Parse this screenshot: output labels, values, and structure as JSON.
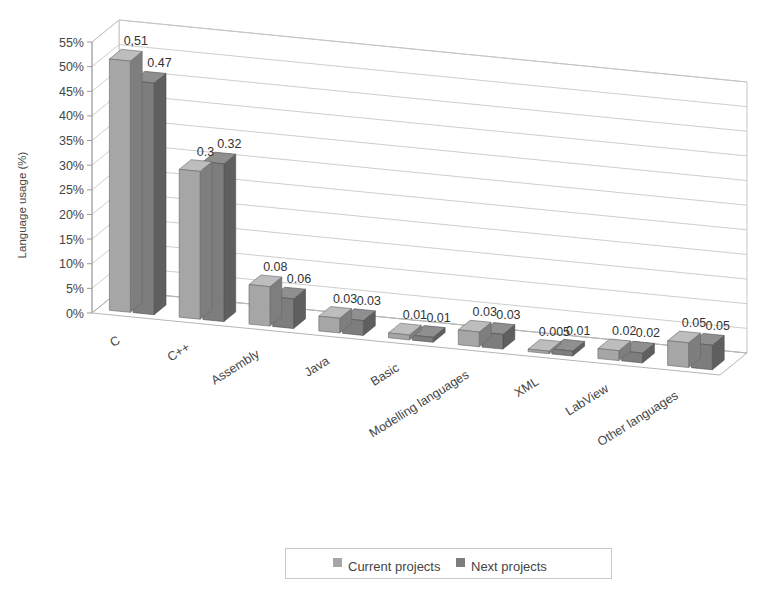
{
  "chart_data": {
    "type": "bar",
    "title": "",
    "subtitle": "",
    "xlabel": "",
    "ylabel": "Language usage (%)",
    "categories": [
      "C",
      "C++",
      "Assembly",
      "Java",
      "Basic",
      "Modelling languages",
      "XML",
      "LabView",
      "Other languages"
    ],
    "series": [
      {
        "name": "Current projects",
        "color": "#a6a6a6",
        "values": [
          0.51,
          0.3,
          0.08,
          0.03,
          0.01,
          0.03,
          0.005,
          0.02,
          0.05
        ],
        "labels": [
          "0,51",
          "0.3",
          "0.08",
          "0.03",
          "0.01",
          "0.03",
          "0.005",
          "0.02",
          "0.05"
        ]
      },
      {
        "name": "Next projects",
        "color": "#7d7d7d",
        "values": [
          0.47,
          0.32,
          0.06,
          0.03,
          0.01,
          0.03,
          0.01,
          0.02,
          0.05
        ],
        "labels": [
          "0.47",
          "0.32",
          "0.06",
          "0.03",
          "0.01",
          "0.03",
          "0.01",
          "0.02",
          "0.05"
        ]
      }
    ],
    "ylim": [
      0,
      0.55
    ],
    "ytick_values": [
      0,
      0.05,
      0.1,
      0.15,
      0.2,
      0.25,
      0.3,
      0.35,
      0.4,
      0.45,
      0.5,
      0.55
    ],
    "ytick_labels": [
      "0%",
      "5%",
      "10%",
      "15%",
      "20%",
      "25%",
      "30%",
      "35%",
      "40%",
      "45%",
      "50%",
      "55%"
    ],
    "grid": true,
    "projection": "3d",
    "legend_position": "bottom",
    "legend_entries": [
      "Current projects",
      "Next projects"
    ]
  },
  "axis": {
    "y_title": "Language usage (%)"
  },
  "legend": {
    "entries": [
      {
        "label": "Current projects",
        "color": "#a6a6a6"
      },
      {
        "label": "Next projects",
        "color": "#7d7d7d"
      }
    ]
  }
}
